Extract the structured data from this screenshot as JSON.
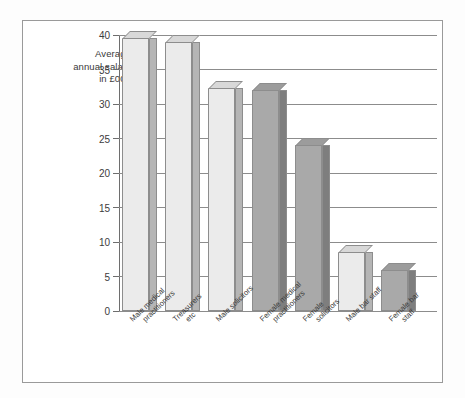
{
  "axis_title": {
    "line1": "Average",
    "line2": "annual salary",
    "line3": "in £000"
  },
  "chart_data": {
    "type": "bar",
    "title": "",
    "subtitle": "",
    "xlabel": "",
    "ylabel": "Average annual salary in £000",
    "ylim": [
      0,
      40
    ],
    "yticks": [
      0,
      5,
      10,
      15,
      20,
      25,
      30,
      35,
      40
    ],
    "ytick_labels": [
      "0",
      "5",
      "10",
      "15",
      "20",
      "25",
      "30",
      "35",
      "40"
    ],
    "grid": true,
    "legend": "none",
    "style": "3d-bar",
    "categories": [
      "Male medical practitioners",
      "Treasurers etc",
      "Male solicitors",
      "Female medical practitioners",
      "Female solicitors",
      "Male bar staff",
      "Female bar staff"
    ],
    "category_lines": [
      [
        "Male medical",
        "practitioners"
      ],
      [
        "Treasurers",
        "etc"
      ],
      [
        "Male solicitors",
        ""
      ],
      [
        "Female medical",
        "practitioners"
      ],
      [
        "Female",
        "solicitors"
      ],
      [
        "Male bar staff",
        ""
      ],
      [
        "Female bar",
        "staff"
      ]
    ],
    "values": [
      39.5,
      39,
      32.3,
      32,
      24,
      8.5,
      6
    ],
    "bar_shades": [
      "light",
      "light",
      "light",
      "dark",
      "dark",
      "light",
      "dark"
    ],
    "colors": {
      "light_front": "#ebebeb",
      "light_side": "#b5b5b5",
      "light_top": "#d8d8d8",
      "dark_front": "#a9a9a9",
      "dark_side": "#7e7e7e",
      "dark_top": "#9c9c9c",
      "outline": "#8d8d8d",
      "gridline": "#8c8c8c",
      "frame": "#9a9a9a",
      "text": "#3a3a3a"
    }
  }
}
